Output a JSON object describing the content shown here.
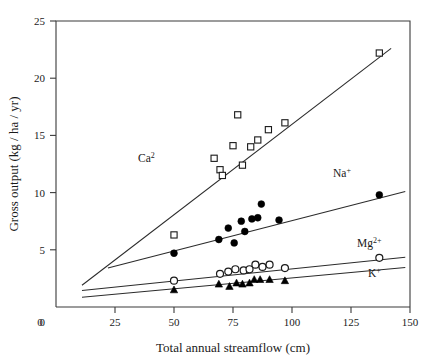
{
  "chart_data": {
    "type": "scatter",
    "title": "",
    "xlabel": "Total annual streamflow (cm)",
    "ylabel": "Gross output (kg / ha / yr)",
    "xlim": [
      0,
      150
    ],
    "ylim": [
      0,
      25
    ],
    "xticks": [
      0,
      25,
      50,
      75,
      100,
      125,
      150
    ],
    "yticks": [
      0,
      5,
      10,
      15,
      20,
      25
    ],
    "xtick_labels": [
      "0",
      "25",
      "50",
      "75",
      "100",
      "125",
      "150"
    ],
    "ytick_labels": [
      "0",
      "5",
      "10",
      "15",
      "20",
      "25"
    ],
    "grid": false,
    "legend_position": "inline-annotations",
    "series": [
      {
        "name": "Ca2",
        "label": "Ca",
        "label_sup": "2",
        "marker": "open-square",
        "label_x": 138,
        "label_y": 162,
        "fit_line": {
          "x1": 11,
          "y1": 1.9,
          "x2": 142,
          "y2": 22.6
        },
        "points": [
          {
            "x": 50.0,
            "y": 6.3
          },
          {
            "x": 67.0,
            "y": 13.0
          },
          {
            "x": 69.5,
            "y": 12.0
          },
          {
            "x": 70.5,
            "y": 11.5
          },
          {
            "x": 75.0,
            "y": 14.1
          },
          {
            "x": 77.0,
            "y": 16.8
          },
          {
            "x": 79.0,
            "y": 12.4
          },
          {
            "x": 82.5,
            "y": 14.0
          },
          {
            "x": 85.5,
            "y": 14.6
          },
          {
            "x": 90.0,
            "y": 15.5
          },
          {
            "x": 97.0,
            "y": 16.1
          },
          {
            "x": 137.0,
            "y": 22.2
          }
        ]
      },
      {
        "name": "Na+",
        "label": "Na",
        "label_sup": "+",
        "marker": "filled-circle",
        "label_x": 333,
        "label_y": 177,
        "fit_line": {
          "x1": 22,
          "y1": 3.4,
          "x2": 148,
          "y2": 10.1
        },
        "points": [
          {
            "x": 50.0,
            "y": 4.7
          },
          {
            "x": 69.0,
            "y": 5.9
          },
          {
            "x": 73.0,
            "y": 6.9
          },
          {
            "x": 75.5,
            "y": 5.6
          },
          {
            "x": 78.5,
            "y": 7.5
          },
          {
            "x": 80.0,
            "y": 6.6
          },
          {
            "x": 83.0,
            "y": 7.7
          },
          {
            "x": 85.5,
            "y": 7.8
          },
          {
            "x": 87.0,
            "y": 9.0
          },
          {
            "x": 94.5,
            "y": 7.6
          },
          {
            "x": 137.0,
            "y": 9.8
          }
        ]
      },
      {
        "name": "Mg2+",
        "label": "Mg",
        "label_sup": "2+",
        "marker": "open-circle",
        "label_x": 357,
        "label_y": 247,
        "fit_line": {
          "x1": 11,
          "y1": 1.45,
          "x2": 148,
          "y2": 4.35
        },
        "points": [
          {
            "x": 50.0,
            "y": 2.3
          },
          {
            "x": 69.5,
            "y": 2.9
          },
          {
            "x": 73.0,
            "y": 3.1
          },
          {
            "x": 76.0,
            "y": 3.3
          },
          {
            "x": 79.5,
            "y": 3.2
          },
          {
            "x": 82.0,
            "y": 3.3
          },
          {
            "x": 84.5,
            "y": 3.7
          },
          {
            "x": 87.5,
            "y": 3.5
          },
          {
            "x": 90.5,
            "y": 3.7
          },
          {
            "x": 97.0,
            "y": 3.4
          },
          {
            "x": 137.0,
            "y": 4.3
          }
        ]
      },
      {
        "name": "K+",
        "label": "K",
        "label_sup": "+",
        "marker": "filled-triangle",
        "label_x": 368,
        "label_y": 277,
        "fit_line": {
          "x1": 11,
          "y1": 0.85,
          "x2": 148,
          "y2": 3.45
        },
        "points": [
          {
            "x": 50.0,
            "y": 1.5
          },
          {
            "x": 69.0,
            "y": 2.0
          },
          {
            "x": 73.5,
            "y": 1.8
          },
          {
            "x": 76.5,
            "y": 2.1
          },
          {
            "x": 79.0,
            "y": 2.0
          },
          {
            "x": 82.0,
            "y": 2.1
          },
          {
            "x": 84.0,
            "y": 2.4
          },
          {
            "x": 86.5,
            "y": 2.4
          },
          {
            "x": 90.5,
            "y": 2.4
          },
          {
            "x": 97.0,
            "y": 2.3
          }
        ]
      }
    ]
  }
}
